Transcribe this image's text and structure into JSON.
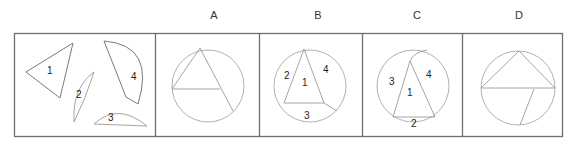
{
  "puzzle": {
    "question_panel": {
      "pieces": [
        {
          "id": "1",
          "label": "1",
          "kind": "triangle"
        },
        {
          "id": "2",
          "label": "2",
          "kind": "circular-segment"
        },
        {
          "id": "3",
          "label": "3",
          "kind": "circular-segment"
        },
        {
          "id": "4",
          "label": "4",
          "kind": "circular-segment"
        }
      ]
    },
    "options": [
      {
        "key": "A",
        "label": "A",
        "piece_labels": []
      },
      {
        "key": "B",
        "label": "B",
        "piece_labels": [
          "2",
          "1",
          "4",
          "3"
        ]
      },
      {
        "key": "C",
        "label": "C",
        "piece_labels": [
          "3",
          "1",
          "4",
          "2"
        ]
      },
      {
        "key": "D",
        "label": "D",
        "piece_labels": []
      }
    ]
  },
  "labels": {
    "q1": "1",
    "q2": "2",
    "q3": "3",
    "q4": "4",
    "b2": "2",
    "b1": "1",
    "b4": "4",
    "b3": "3",
    "c3": "3",
    "c1": "1",
    "c4": "4",
    "c2": "2"
  },
  "colors": {
    "frame": "#6e6e6e",
    "line": "#9a9a9a",
    "text": "#222222"
  }
}
